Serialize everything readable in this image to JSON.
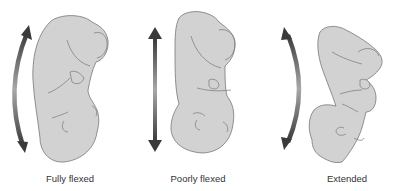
{
  "diagram": {
    "colors": {
      "figure_fill": "#d2d2d2",
      "figure_stroke": "#777777",
      "arrow_dark": "#3a3a3a",
      "arrow_light": "#a8a8a8",
      "caption": "#333333",
      "background": "#ffffff"
    },
    "panels": [
      {
        "id": "fully-flexed",
        "label": "Fully flexed",
        "arrow": "curved-convex-left"
      },
      {
        "id": "poorly-flexed",
        "label": "Poorly flexed",
        "arrow": "straight-vertical"
      },
      {
        "id": "extended",
        "label": "Extended",
        "arrow": "curved-concave-left"
      }
    ]
  }
}
